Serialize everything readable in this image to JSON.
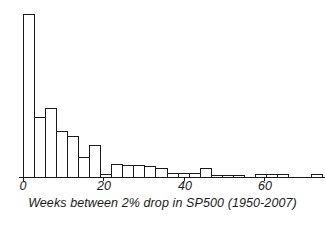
{
  "figure": {
    "caption": "Weeks between 2% drop in SP500 (1950-2007)",
    "ink_color": "#1a1a1a",
    "background_color": "#ffffff"
  },
  "axis": {
    "tick_labels": [
      "0",
      "20",
      "40",
      "60"
    ],
    "tick_values": [
      0,
      20,
      40,
      60
    ]
  },
  "chart_data": {
    "type": "bar",
    "title": "",
    "subtitle": "",
    "xlabel": "Weeks between 2% drop in SP500 (1950-2007)",
    "ylabel": "",
    "grid": false,
    "legend": "none",
    "bin_width": 2.75,
    "xlim": [
      0,
      75
    ],
    "ylim": [
      0,
      163
    ],
    "xtick_labels": [
      "0",
      "20",
      "40",
      "60"
    ],
    "xticks": [
      0,
      20,
      40,
      60
    ],
    "bin_starts": [
      0,
      2.75,
      5.5,
      8.25,
      11,
      13.75,
      16.5,
      19.25,
      22,
      24.75,
      27.5,
      30.25,
      33,
      35.75,
      38.5,
      41.25,
      44,
      46.75,
      49.5,
      52.25,
      55,
      57.75,
      60.5,
      63.25,
      66,
      68.75,
      71.5
    ],
    "categories": [
      "0-2.75",
      "2.75-5.5",
      "5.5-8.25",
      "8.25-11",
      "11-13.75",
      "13.75-16.5",
      "16.5-19.25",
      "19.25-22",
      "22-24.75",
      "24.75-27.5",
      "27.5-30.25",
      "30.25-33",
      "33-35.75",
      "35.75-38.5",
      "38.5-41.25",
      "41.25-44",
      "44-46.75",
      "46.75-49.5",
      "49.5-52.25",
      "52.25-55",
      "55-57.75",
      "57.75-60.5",
      "60.5-63.25",
      "63.25-66",
      "66-68.75",
      "68.75-71.5",
      "71.5-74.25"
    ],
    "values": [
      163,
      60,
      69,
      46,
      41,
      20,
      32,
      3,
      13,
      12,
      12,
      11,
      9,
      4,
      4,
      4,
      9,
      2,
      2,
      2,
      0,
      3,
      3,
      3,
      0,
      0,
      3
    ],
    "values_label": "count"
  }
}
